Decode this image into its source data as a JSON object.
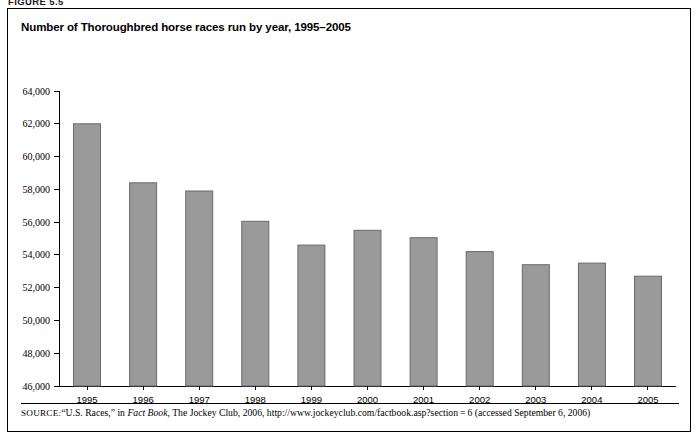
{
  "figure": {
    "caption": "FIGURE 5.5"
  },
  "chart_data": {
    "type": "bar",
    "title": "Number of Thoroughbred horse races run by year, 1995–2005",
    "xlabel": "",
    "ylabel": "",
    "categories": [
      "1995",
      "1996",
      "1997",
      "1998",
      "1999",
      "2000",
      "2001",
      "2002",
      "2003",
      "2004",
      "2005"
    ],
    "values": [
      62000,
      58400,
      57900,
      56050,
      54600,
      55500,
      55050,
      54200,
      53400,
      53500,
      52700
    ],
    "ylim": [
      46000,
      64000
    ],
    "ytick_values": [
      46000,
      48000,
      50000,
      52000,
      54000,
      56000,
      58000,
      60000,
      62000,
      64000
    ],
    "ytick_labels": [
      "46,000",
      "48,000",
      "50,000",
      "52,000",
      "54,000",
      "56,000",
      "58,000",
      "60,000",
      "62,000",
      "64,000"
    ],
    "grid": false,
    "legend": null,
    "bar_color": "#9a9a9a",
    "bar_border_color": "#6a6a6a"
  },
  "source": {
    "label": "SOURCE:",
    "text_part1": "“U.S. Races,” in ",
    "italic_title": "Fact Book",
    "text_part2": ", The Jockey Club, 2006, http://www.jockeyclub.com/factbook.asp?section = 6 (accessed September 6, 2006)"
  }
}
